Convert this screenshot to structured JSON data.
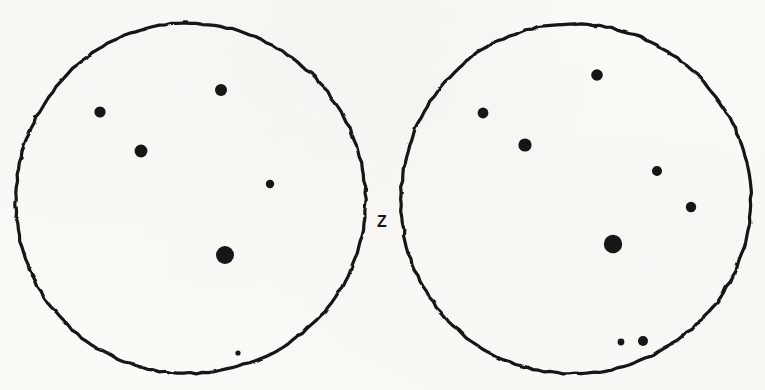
{
  "figure": {
    "background_color": "#fbfaf7",
    "ink_color": "#141414",
    "width": 765,
    "height": 390,
    "center_label": {
      "text": "Z",
      "x": 382,
      "y": 222,
      "font_size": 16
    }
  },
  "chart_data": {
    "type": "scatter",
    "subtitle": "",
    "xlabel": "",
    "ylabel": "",
    "grid": false,
    "legend": "none",
    "annotations": [
      {
        "name": "zenith-label",
        "text": "Z",
        "x": 382,
        "y": 222
      }
    ],
    "panels": [
      {
        "name": "left-circle",
        "label": "",
        "center": [
          190,
          199
        ],
        "radius": 175,
        "outline_width": 3.2,
        "points": [
          {
            "id": "L1",
            "x": 221,
            "y": 90,
            "r": 6.0,
            "size": "medium"
          },
          {
            "id": "L2",
            "x": 100,
            "y": 112,
            "r": 5.6,
            "size": "medium"
          },
          {
            "id": "L3",
            "x": 141,
            "y": 151,
            "r": 6.4,
            "size": "medium"
          },
          {
            "id": "L4",
            "x": 270,
            "y": 184,
            "r": 4.2,
            "size": "small"
          },
          {
            "id": "L5",
            "x": 225,
            "y": 255,
            "r": 9.0,
            "size": "large"
          },
          {
            "id": "L6",
            "x": 238,
            "y": 353,
            "r": 2.6,
            "size": "tiny"
          }
        ]
      },
      {
        "name": "right-circle",
        "label": "",
        "center": [
          575,
          199
        ],
        "radius": 175,
        "outline_width": 3.2,
        "points": [
          {
            "id": "R1",
            "x": 597,
            "y": 75,
            "r": 5.8,
            "size": "medium"
          },
          {
            "id": "R2",
            "x": 483,
            "y": 113,
            "r": 5.4,
            "size": "medium"
          },
          {
            "id": "R3",
            "x": 525,
            "y": 145,
            "r": 6.6,
            "size": "medium"
          },
          {
            "id": "R4",
            "x": 657,
            "y": 171,
            "r": 5.0,
            "size": "small"
          },
          {
            "id": "R5",
            "x": 691,
            "y": 207,
            "r": 5.2,
            "size": "small"
          },
          {
            "id": "R6",
            "x": 613,
            "y": 244,
            "r": 9.2,
            "size": "large"
          },
          {
            "id": "R7",
            "x": 621,
            "y": 342,
            "r": 3.4,
            "size": "tiny"
          },
          {
            "id": "R8",
            "x": 643,
            "y": 341,
            "r": 5.0,
            "size": "small"
          }
        ]
      }
    ]
  }
}
